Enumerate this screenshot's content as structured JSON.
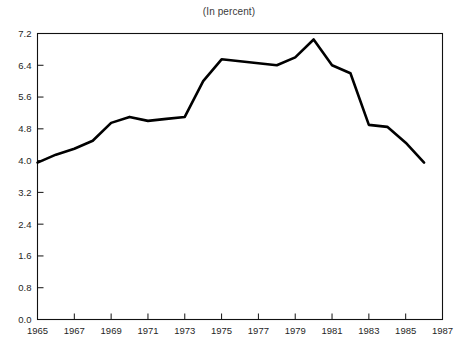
{
  "figure": {
    "title": "",
    "subtitle": "(In percent)"
  },
  "chart_data": {
    "type": "line",
    "title": "",
    "subtitle": "(In percent)",
    "xlabel": "",
    "ylabel": "",
    "xlim": [
      1965,
      1987
    ],
    "ylim": [
      0.0,
      7.2
    ],
    "grid": false,
    "legend": "none",
    "y_ticks": [
      "0.0",
      "0.8",
      "1.6",
      "2.4",
      "3.2",
      "4.0",
      "4.8",
      "5.6",
      "6.4",
      "7.2"
    ],
    "y_tick_values": [
      0.0,
      0.8,
      1.6,
      2.4,
      3.2,
      4.0,
      4.8,
      5.6,
      6.4,
      7.2
    ],
    "x_ticks": [
      "1965",
      "1967",
      "1969",
      "1971",
      "1973",
      "1975",
      "1977",
      "1979",
      "1981",
      "1983",
      "1985",
      "1987"
    ],
    "x_tick_values": [
      1965,
      1967,
      1969,
      1971,
      1973,
      1975,
      1977,
      1979,
      1981,
      1983,
      1985,
      1987
    ],
    "x": [
      1965,
      1966,
      1967,
      1968,
      1969,
      1970,
      1971,
      1972,
      1973,
      1974,
      1975,
      1976,
      1977,
      1978,
      1979,
      1980,
      1981,
      1982,
      1983,
      1984,
      1985,
      1986
    ],
    "values": [
      3.95,
      4.15,
      4.3,
      4.5,
      4.95,
      5.1,
      5.0,
      5.05,
      5.1,
      6.0,
      6.55,
      6.5,
      6.45,
      6.4,
      6.6,
      7.05,
      6.4,
      6.2,
      4.9,
      4.85,
      4.45,
      3.95
    ],
    "series": [
      {
        "name": "series-1",
        "color": "#000000",
        "values": [
          3.95,
          4.15,
          4.3,
          4.5,
          4.95,
          5.1,
          5.0,
          5.05,
          5.1,
          6.0,
          6.55,
          6.5,
          6.45,
          6.4,
          6.6,
          7.05,
          6.4,
          6.2,
          4.9,
          4.85,
          4.45,
          3.95
        ]
      }
    ]
  },
  "colors": {
    "line": "#000000",
    "axis": "#111111",
    "background": "#ffffff",
    "text": "#1f1f1f"
  }
}
